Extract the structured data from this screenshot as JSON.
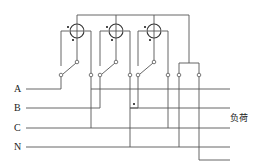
{
  "diagram": {
    "type": "wiring-diagram",
    "lines": [
      {
        "label": "A"
      },
      {
        "label": "B"
      },
      {
        "label": "C"
      },
      {
        "label": "N"
      }
    ],
    "load_label": "负荷",
    "meter_elements": 3,
    "colors": {
      "line": "#555555",
      "text": "#222222",
      "background": "#ffffff"
    }
  }
}
